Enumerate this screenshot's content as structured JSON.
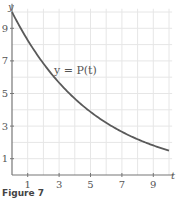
{
  "chart_data": {
    "type": "line",
    "title": "",
    "xlabel": "t",
    "ylabel": "y",
    "xlim": [
      0,
      10
    ],
    "ylim": [
      0,
      10.5
    ],
    "grid": true,
    "x_ticks": [
      1,
      3,
      5,
      7,
      9
    ],
    "y_ticks": [
      1,
      3,
      5,
      7,
      9
    ],
    "series": [
      {
        "name": "y = P(t)",
        "x": [
          0,
          1,
          2,
          3,
          4,
          5,
          6,
          7,
          8,
          9,
          10
        ],
        "values": [
          10.0,
          8.27,
          6.84,
          5.66,
          4.68,
          3.87,
          3.2,
          2.64,
          2.19,
          1.81,
          1.5
        ]
      }
    ],
    "annotations": [
      {
        "text": "y = P(t)",
        "x": 3,
        "y": 6.5
      }
    ]
  },
  "labels": {
    "x_axis": "t",
    "y_axis": "y",
    "curve": "y = P(t)",
    "caption": "Figure 7"
  },
  "colors": {
    "curve": "#5a5a5a",
    "grid": "#e6e6e6",
    "axis": "#777777"
  }
}
